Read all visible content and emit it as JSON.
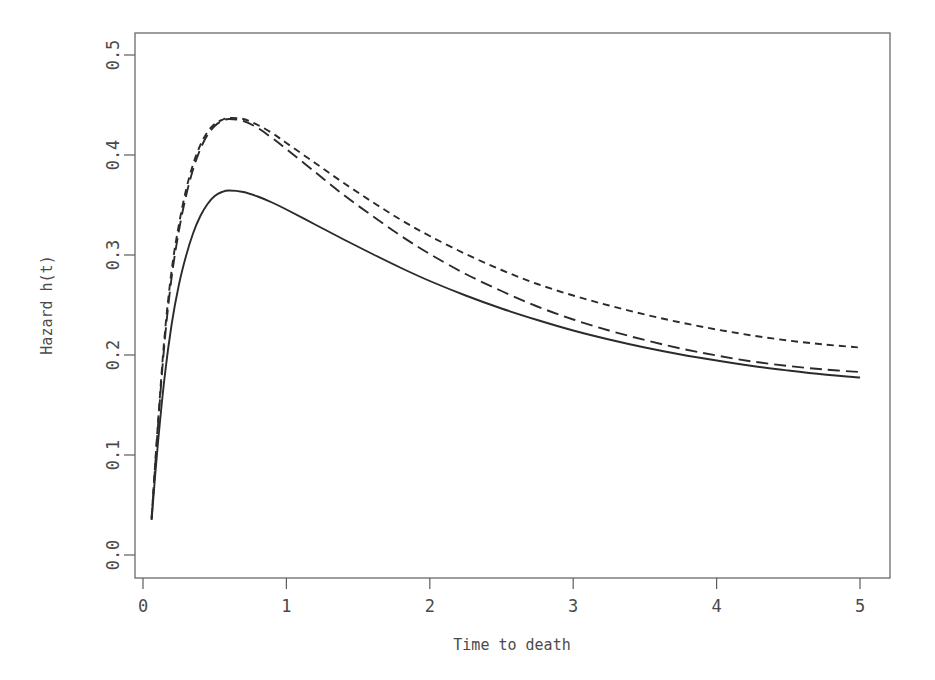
{
  "chart_data": {
    "type": "line",
    "title": "",
    "xlabel": "Time to death",
    "ylabel": "Hazard h(t)",
    "xlim": [
      0,
      5.25
    ],
    "ylim": [
      0,
      0.52
    ],
    "xticks": [
      0,
      1,
      2,
      3,
      4,
      5
    ],
    "xtick_labels": [
      "0",
      "1",
      "2",
      "3",
      "4",
      "5"
    ],
    "yticks": [
      0.0,
      0.1,
      0.2,
      0.3,
      0.4,
      0.5
    ],
    "ytick_labels": [
      "0.0",
      "0.1",
      "0.2",
      "0.3",
      "0.4",
      "0.5"
    ],
    "grid": false,
    "legend": "none",
    "line_color": "#2b2b2b",
    "frame_color": "#5d5d5d",
    "background": "#ffffff",
    "x": [
      0.06,
      0.1,
      0.15,
      0.2,
      0.25,
      0.3,
      0.35,
      0.4,
      0.45,
      0.5,
      0.55,
      0.6,
      0.7,
      0.8,
      0.9,
      1.0,
      1.2,
      1.4,
      1.6,
      1.8,
      2.0,
      2.25,
      2.5,
      2.75,
      3.0,
      3.25,
      3.5,
      3.75,
      4.0,
      4.25,
      4.5,
      4.75,
      5.0
    ],
    "series": [
      {
        "name": "upper-dashed",
        "style": "dashed",
        "dash_pattern": "7,5",
        "values": [
          0.037,
          0.123,
          0.218,
          0.285,
          0.33,
          0.365,
          0.391,
          0.41,
          0.423,
          0.431,
          0.435,
          0.437,
          0.436,
          0.43,
          0.422,
          0.412,
          0.392,
          0.372,
          0.353,
          0.335,
          0.319,
          0.301,
          0.285,
          0.271,
          0.2595,
          0.2495,
          0.2405,
          0.2325,
          0.2255,
          0.2195,
          0.2145,
          0.2105,
          0.2075
        ]
      },
      {
        "name": "middle-dashed",
        "style": "dashed",
        "dash_pattern": "12,6",
        "values": [
          0.036,
          0.12,
          0.212,
          0.278,
          0.324,
          0.359,
          0.386,
          0.406,
          0.42,
          0.429,
          0.434,
          0.436,
          0.434,
          0.427,
          0.417,
          0.406,
          0.383,
          0.36,
          0.339,
          0.319,
          0.301,
          0.281,
          0.264,
          0.2485,
          0.2355,
          0.2245,
          0.215,
          0.2065,
          0.1995,
          0.1935,
          0.189,
          0.1855,
          0.183
        ]
      },
      {
        "name": "solid",
        "style": "solid",
        "dash_pattern": "none",
        "values": [
          0.035,
          0.105,
          0.177,
          0.231,
          0.27,
          0.299,
          0.322,
          0.339,
          0.351,
          0.359,
          0.363,
          0.3645,
          0.363,
          0.3585,
          0.3525,
          0.3455,
          0.3305,
          0.3155,
          0.301,
          0.287,
          0.274,
          0.2595,
          0.2465,
          0.235,
          0.2245,
          0.2155,
          0.2075,
          0.2005,
          0.1945,
          0.189,
          0.1845,
          0.1805,
          0.1775
        ]
      }
    ]
  }
}
